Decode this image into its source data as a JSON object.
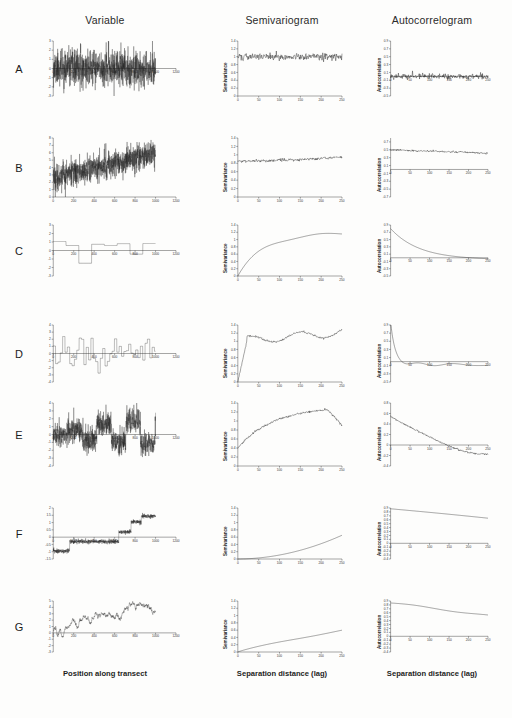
{
  "figure": {
    "columns": [
      {
        "id": "variable",
        "label": "Variable",
        "xlabel": "Position along transect",
        "ylabel": "Variable"
      },
      {
        "id": "semivariogram",
        "label": "Semivariogram",
        "xlabel": "Separation distance (lag)",
        "ylabel": "Semivariance"
      },
      {
        "id": "autocorrelogram",
        "label": "Autocorrelogram",
        "xlabel": "Separation distance (lag)",
        "ylabel": "Autocorrelation"
      }
    ],
    "row_labels": [
      "A",
      "B",
      "C",
      "D",
      "E",
      "F",
      "G"
    ],
    "xlabel_transect": "Position along transect",
    "xlabel_lag": "Separation distance (lag)",
    "ylabel_semivariance": "Semivariance",
    "ylabel_autocorrelation": "Autocorrelation",
    "line_color": "#111111",
    "axis_color": "#3a3a3a"
  },
  "chart_data": [
    {
      "id": "A-variable",
      "type": "line",
      "row": "A",
      "column": "Variable",
      "title": "Variable",
      "xlabel": "Position along transect",
      "ylabel": "Variable",
      "xlim": [
        0,
        1200
      ],
      "ylim": [
        -3,
        3
      ],
      "xticks": [
        0,
        200,
        400,
        600,
        800,
        1000,
        1200
      ],
      "yticks": [
        -3,
        -2,
        -1,
        0,
        1,
        2,
        3
      ],
      "description": "White noise, no spatial structure; random values fluctuating about mean 0 across transect 0-1000",
      "grid": false,
      "legend": null
    },
    {
      "id": "A-semivariogram",
      "type": "line",
      "row": "A",
      "column": "Semivariogram",
      "title": "Semivariogram",
      "xlabel": "Separation distance (lag)",
      "ylabel": "Semivariance",
      "xlim": [
        0,
        250
      ],
      "ylim": [
        0,
        1.4
      ],
      "xticks": [
        0,
        50,
        100,
        150,
        200,
        250
      ],
      "yticks": [
        0,
        0.2,
        0.4,
        0.6,
        0.8,
        1.0,
        1.2,
        1.4
      ],
      "description": "Flat pure nugget semivariogram at approximately 1.0 across all lags",
      "nugget": 1.0,
      "sill": 1.0,
      "range": 0,
      "grid": false,
      "legend": null
    },
    {
      "id": "A-autocorrelogram",
      "type": "line",
      "row": "A",
      "column": "Autocorrelogram",
      "title": "Autocorrelogram",
      "xlabel": "Separation distance (lag)",
      "ylabel": "Autocorrelation",
      "xlim": [
        0,
        250
      ],
      "ylim": [
        -0.5,
        0.9
      ],
      "xticks": [
        0,
        50,
        100,
        150,
        200,
        250
      ],
      "yticks": [
        -0.5,
        -0.3,
        -0.1,
        0.1,
        0.3,
        0.5,
        0.7,
        0.9
      ],
      "description": "Autocorrelation near zero at all lags",
      "grid": false,
      "legend": null
    },
    {
      "id": "B-variable",
      "type": "line",
      "row": "B",
      "column": "Variable",
      "title": "Variable",
      "xlabel": "Position along transect",
      "ylabel": "Variable",
      "xlim": [
        0,
        1200
      ],
      "ylim": [
        0,
        8
      ],
      "xticks": [
        0,
        200,
        400,
        600,
        800,
        1000,
        1200
      ],
      "yticks": [
        0,
        1,
        2,
        3,
        4,
        5,
        6,
        7,
        8
      ],
      "description": "White noise superimposed on a linear increasing trend from about 3 to 6",
      "grid": false,
      "legend": null
    },
    {
      "id": "B-semivariogram",
      "type": "line",
      "row": "B",
      "column": "Semivariogram",
      "title": "Semivariogram",
      "xlabel": "Separation distance (lag)",
      "ylabel": "Semivariance",
      "xlim": [
        0,
        250
      ],
      "ylim": [
        0,
        1.4
      ],
      "xticks": [
        0,
        50,
        100,
        150,
        200,
        250
      ],
      "yticks": [
        0,
        0.2,
        0.4,
        0.6,
        0.8,
        1.0,
        1.2,
        1.4
      ],
      "description": "Nearly flat near 0.85, slowly rising to about 0.92 at lag 250",
      "nugget": 0.85,
      "sill": 0.92,
      "grid": false,
      "legend": null
    },
    {
      "id": "B-autocorrelogram",
      "type": "line",
      "row": "B",
      "column": "Autocorrelogram",
      "title": "Autocorrelogram",
      "xlabel": "Separation distance (lag)",
      "ylabel": "Autocorrelation",
      "xlim": [
        0,
        250
      ],
      "ylim": [
        -0.7,
        0.8
      ],
      "xticks": [
        0,
        50,
        100,
        150,
        200,
        250
      ],
      "yticks": [
        -0.7,
        -0.5,
        -0.3,
        -0.1,
        0.1,
        0.3,
        0.5,
        0.7
      ],
      "description": "Held around 0.5 with slow linear decline to about 0.42",
      "grid": false,
      "legend": null
    },
    {
      "id": "C-variable",
      "type": "line",
      "row": "C",
      "column": "Variable",
      "title": "Variable",
      "xlabel": "Position along transect",
      "ylabel": "Variable",
      "xlim": [
        0,
        1200
      ],
      "ylim": [
        -3,
        3
      ],
      "xticks": [
        0,
        200,
        400,
        600,
        800,
        1000,
        1200
      ],
      "yticks": [
        -3,
        -2,
        -1,
        0,
        1,
        2,
        3
      ],
      "description": "Step function with few long patches; large-scale patchiness",
      "grid": false,
      "legend": null
    },
    {
      "id": "C-semivariogram",
      "type": "line",
      "row": "C",
      "column": "Semivariogram",
      "title": "Semivariogram",
      "xlabel": "Separation distance (lag)",
      "ylabel": "Semivariance",
      "xlim": [
        0,
        250
      ],
      "ylim": [
        0,
        1.4
      ],
      "xticks": [
        0,
        50,
        100,
        150,
        200,
        250
      ],
      "yticks": [
        0,
        0.2,
        0.4,
        0.6,
        0.8,
        1.0,
        1.2,
        1.4
      ],
      "description": "Rises steadily from 0 reaching a sill near 1.15-1.2 around lag 150",
      "nugget": 0.0,
      "sill": 1.2,
      "range": 150,
      "grid": false,
      "legend": null
    },
    {
      "id": "C-autocorrelogram",
      "type": "line",
      "row": "C",
      "column": "Autocorrelogram",
      "title": "Autocorrelogram",
      "xlabel": "Separation distance (lag)",
      "ylabel": "Autocorrelation",
      "xlim": [
        0,
        250
      ],
      "ylim": [
        -0.5,
        0.9
      ],
      "xticks": [
        0,
        50,
        100,
        150,
        200,
        250
      ],
      "yticks": [
        -0.5,
        -0.3,
        -0.1,
        0.1,
        0.3,
        0.5,
        0.7,
        0.9
      ],
      "description": "Smooth exponential decay from about 0.8 crossing zero near lag 150",
      "grid": false,
      "legend": null
    },
    {
      "id": "D-variable",
      "type": "line",
      "row": "D",
      "column": "Variable",
      "title": "Variable",
      "xlabel": "Position along transect",
      "ylabel": "Variable",
      "xlim": [
        0,
        1200
      ],
      "ylim": [
        -4,
        4
      ],
      "xticks": [
        0,
        200,
        400,
        600,
        800,
        1000,
        1200
      ],
      "yticks": [
        -4,
        -3,
        -2,
        -1,
        0,
        1,
        2,
        3,
        4
      ],
      "description": "Step function with many short patches; fine-scale patchiness",
      "grid": false,
      "legend": null
    },
    {
      "id": "D-semivariogram",
      "type": "line",
      "row": "D",
      "column": "Semivariogram",
      "title": "Semivariogram",
      "xlabel": "Separation distance (lag)",
      "ylabel": "Semivariance",
      "xlim": [
        0,
        250
      ],
      "ylim": [
        0,
        1.4
      ],
      "xticks": [
        0,
        50,
        100,
        150,
        200,
        250
      ],
      "yticks": [
        0,
        0.2,
        0.4,
        0.6,
        0.8,
        1.0,
        1.2,
        1.4
      ],
      "description": "Rises very steeply to about 1.0 by lag 25 then fluctuates around 1.0-1.2",
      "nugget": 0.0,
      "sill": 1.05,
      "range": 25,
      "grid": false,
      "legend": null
    },
    {
      "id": "D-autocorrelogram",
      "type": "line",
      "row": "D",
      "column": "Autocorrelogram",
      "title": "Autocorrelogram",
      "xlabel": "Separation distance (lag)",
      "ylabel": "Autocorrelation",
      "xlim": [
        0,
        250
      ],
      "ylim": [
        -0.5,
        0.9
      ],
      "xticks": [
        0,
        50,
        100,
        150,
        200,
        250
      ],
      "yticks": [
        -0.5,
        -0.3,
        -0.1,
        0.1,
        0.3,
        0.5,
        0.7,
        0.9
      ],
      "description": "Sharp drop from 0.85 to near zero by lag 25, then oscillating about zero with dips to -0.2",
      "grid": false,
      "legend": null
    },
    {
      "id": "E-variable",
      "type": "line",
      "row": "E",
      "column": "Variable",
      "title": "Variable",
      "xlabel": "Position along transect",
      "ylabel": "Variable",
      "xlim": [
        0,
        1200
      ],
      "ylim": [
        -4,
        4
      ],
      "xticks": [
        0,
        200,
        400,
        600,
        800,
        1000,
        1200
      ],
      "yticks": [
        -4,
        -3,
        -2,
        -1,
        0,
        1,
        2,
        3,
        4
      ],
      "description": "Noise superimposed on broad patch structure; combination of nugget and patchiness",
      "grid": false,
      "legend": null
    },
    {
      "id": "E-semivariogram",
      "type": "line",
      "row": "E",
      "column": "Semivariogram",
      "title": "Semivariogram",
      "xlabel": "Separation distance (lag)",
      "ylabel": "Semivariance",
      "xlim": [
        0,
        250
      ],
      "ylim": [
        0,
        1.4
      ],
      "xticks": [
        0,
        50,
        100,
        150,
        200,
        250
      ],
      "yticks": [
        0,
        0.2,
        0.4,
        0.6,
        0.8,
        1.0,
        1.2,
        1.4
      ],
      "description": "Starts at nugget about 0.4, rises to peak near 1.3 at lag 215 then declines to 1.05",
      "nugget": 0.4,
      "sill": 1.3,
      "range": 215,
      "grid": false,
      "legend": null
    },
    {
      "id": "E-autocorrelogram",
      "type": "line",
      "row": "E",
      "column": "Autocorrelogram",
      "title": "Autocorrelogram",
      "xlabel": "Separation distance (lag)",
      "ylabel": "Autocorrelation",
      "xlim": [
        0,
        250
      ],
      "ylim": [
        -0.4,
        0.8
      ],
      "xticks": [
        0,
        50,
        100,
        150,
        200,
        250
      ],
      "yticks": [
        -0.4,
        -0.2,
        0.0,
        0.2,
        0.4,
        0.6,
        0.8
      ],
      "description": "Decays from about 0.55 crossing zero near lag 110 and reaching about -0.22",
      "grid": false,
      "legend": null
    },
    {
      "id": "F-variable",
      "type": "line",
      "row": "F",
      "column": "Variable",
      "title": "Variable",
      "xlabel": "Position along transect",
      "ylabel": "Variable",
      "xlim": [
        0,
        1200
      ],
      "ylim": [
        -1.5,
        2.0
      ],
      "xticks": [
        0,
        200,
        400,
        600,
        800,
        1000,
        1200
      ],
      "yticks": [
        -1.5,
        -1.0,
        -0.5,
        0.0,
        0.5,
        1.0,
        1.5,
        2.0
      ],
      "description": "Ascending staircase: series of rising plateaus producing a strong gradient",
      "grid": false,
      "legend": null
    },
    {
      "id": "F-semivariogram",
      "type": "line",
      "row": "F",
      "column": "Semivariogram",
      "title": "Semivariogram",
      "xlabel": "Separation distance (lag)",
      "ylabel": "Semivariance",
      "xlim": [
        0,
        250
      ],
      "ylim": [
        0,
        1.4
      ],
      "xticks": [
        0,
        50,
        100,
        150,
        200,
        250
      ],
      "yticks": [
        0,
        0.2,
        0.4,
        0.6,
        0.8,
        1.0,
        1.2,
        1.4
      ],
      "description": "Convex upward curve rising from 0 to about 0.62 at lag 250, no sill reached",
      "nugget": 0.0,
      "grid": false,
      "legend": null
    },
    {
      "id": "F-autocorrelogram",
      "type": "line",
      "row": "F",
      "column": "Autocorrelogram",
      "title": "Autocorrelogram",
      "xlabel": "Separation distance (lag)",
      "ylabel": "Autocorrelation",
      "xlim": [
        0,
        250
      ],
      "ylim": [
        -0.4,
        0.9
      ],
      "xticks": [
        0,
        50,
        100,
        150,
        200,
        250
      ],
      "yticks": [
        -0.4,
        -0.3,
        -0.2,
        -0.1,
        0.0,
        0.1,
        0.2,
        0.3,
        0.4,
        0.5,
        0.6,
        0.7,
        0.8,
        0.9
      ],
      "description": "Very high autocorrelation declining slowly from about 0.88 to 0.66 at lag 250",
      "grid": false,
      "legend": null
    },
    {
      "id": "G-variable",
      "type": "line",
      "row": "G",
      "column": "Variable",
      "title": "Variable",
      "xlabel": "Position along transect",
      "ylabel": "Variable",
      "xlim": [
        0,
        1200
      ],
      "ylim": [
        -3,
        5
      ],
      "xticks": [
        0,
        200,
        400,
        600,
        800,
        1000,
        1200
      ],
      "yticks": [
        -3,
        -2,
        -1,
        0,
        1,
        2,
        3,
        4,
        5
      ],
      "description": "Random walk with overall increasing trend from about 0 to 3.5",
      "grid": false,
      "legend": null
    },
    {
      "id": "G-semivariogram",
      "type": "line",
      "row": "G",
      "column": "Semivariogram",
      "title": "Semivariogram",
      "xlabel": "Separation distance (lag)",
      "ylabel": "Semivariance",
      "xlim": [
        0,
        250
      ],
      "ylim": [
        0,
        1.4
      ],
      "xticks": [
        0,
        50,
        100,
        150,
        200,
        250
      ],
      "yticks": [
        0,
        0.2,
        0.4,
        0.6,
        0.8,
        1.0,
        1.2,
        1.4
      ],
      "description": "Rises steadily and almost linearly from 0 to about 0.6 at lag 250, unbounded",
      "nugget": 0.0,
      "grid": false,
      "legend": null
    },
    {
      "id": "G-autocorrelogram",
      "type": "line",
      "row": "G",
      "column": "Autocorrelogram",
      "title": "Autocorrelogram",
      "xlabel": "Separation distance (lag)",
      "ylabel": "Autocorrelation",
      "xlim": [
        0,
        250
      ],
      "ylim": [
        -0.4,
        0.9
      ],
      "xticks": [
        0,
        50,
        100,
        150,
        200,
        250
      ],
      "yticks": [
        -0.4,
        -0.3,
        -0.2,
        -0.1,
        0.0,
        0.1,
        0.2,
        0.3,
        0.4,
        0.5,
        0.6,
        0.7,
        0.8,
        0.9
      ],
      "description": "High autocorrelation decaying slowly from about 0.85 to 0.55 at lag 250",
      "grid": false,
      "legend": null
    }
  ]
}
